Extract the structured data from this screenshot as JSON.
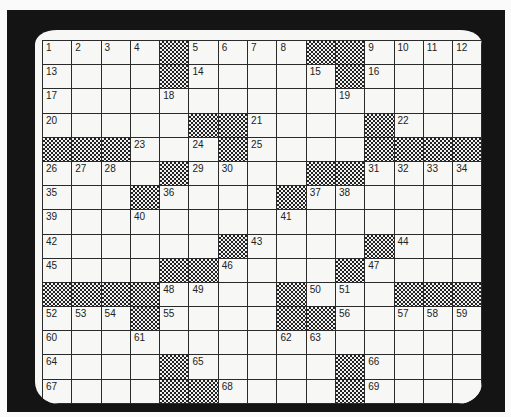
{
  "puzzle": {
    "rows": 15,
    "cols": 15,
    "colors": {
      "frame": "#141414",
      "screen": "#f7f7f5",
      "grid_line": "#2a2a2a",
      "block_pattern": "#222222"
    },
    "grid": [
      [
        "1",
        "2",
        "3",
        "4",
        "#",
        "5",
        "6",
        "7",
        "8",
        "#",
        "#",
        "9",
        "10",
        "11",
        "12"
      ],
      [
        "13",
        "",
        "",
        "",
        "#",
        "14",
        "",
        "",
        "",
        "15",
        "#",
        "16",
        "",
        "",
        ""
      ],
      [
        "17",
        "",
        "",
        "",
        "18",
        "",
        "",
        "",
        "",
        "",
        "19",
        "",
        "",
        "",
        ""
      ],
      [
        "20",
        "",
        "",
        "",
        "",
        "#",
        "#",
        "21",
        "",
        "",
        "",
        "#",
        "22",
        "",
        ""
      ],
      [
        "#",
        "#",
        "#",
        "23",
        "",
        "24",
        "#",
        "25",
        "",
        "",
        "",
        "#",
        "#",
        "#",
        "#"
      ],
      [
        "26",
        "27",
        "28",
        "",
        "#",
        "29",
        "30",
        "",
        "",
        "#",
        "#",
        "31",
        "32",
        "33",
        "34"
      ],
      [
        "35",
        "",
        "",
        "#",
        "36",
        "",
        "",
        "",
        "#",
        "37",
        "38",
        "",
        "",
        "",
        ""
      ],
      [
        "39",
        "",
        "",
        "40",
        "",
        "",
        "",
        "",
        "41",
        "",
        "",
        "",
        "",
        "",
        ""
      ],
      [
        "42",
        "",
        "",
        "",
        "",
        "",
        "#",
        "43",
        "",
        "",
        "",
        "#",
        "44",
        "",
        ""
      ],
      [
        "45",
        "",
        "",
        "",
        "#",
        "#",
        "46",
        "",
        "",
        "",
        "#",
        "47",
        "",
        "",
        ""
      ],
      [
        "#",
        "#",
        "#",
        "#",
        "48",
        "49",
        "",
        "",
        "#",
        "50",
        "51",
        "",
        "#",
        "#",
        "#"
      ],
      [
        "52",
        "53",
        "54",
        "#",
        "55",
        "",
        "",
        "",
        "#",
        "#",
        "56",
        "",
        "57",
        "58",
        "59"
      ],
      [
        "60",
        "",
        "",
        "61",
        "",
        "",
        "",
        "",
        "62",
        "63",
        "",
        "",
        "",
        "",
        ""
      ],
      [
        "64",
        "",
        "",
        "",
        "#",
        "65",
        "",
        "",
        "",
        "",
        "#",
        "66",
        "",
        "",
        ""
      ],
      [
        "67",
        "",
        "",
        "",
        "#",
        "#",
        "68",
        "",
        "",
        "",
        "#",
        "69",
        "",
        "",
        ""
      ]
    ]
  }
}
